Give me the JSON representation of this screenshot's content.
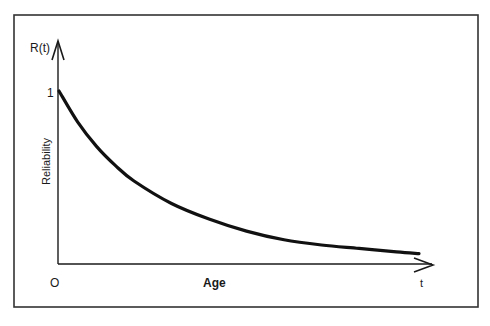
{
  "chart_data": {
    "type": "line",
    "title": "",
    "xlabel": "Age",
    "ylabel": "Reliability",
    "y_axis_symbol": "R(t)",
    "x_axis_symbol": "t",
    "x_tick_labels": [
      "O",
      "t"
    ],
    "y_tick_labels": [
      "1"
    ],
    "grid": false,
    "legend": null,
    "ylim": [
      0,
      1
    ],
    "xlim": [
      0,
      1
    ],
    "series": [
      {
        "name": "R(t)",
        "x": [
          0.0,
          0.05,
          0.1,
          0.15,
          0.2,
          0.3,
          0.4,
          0.5,
          0.6,
          0.7,
          0.8,
          0.9,
          0.96
        ],
        "values": [
          1.0,
          0.82,
          0.68,
          0.57,
          0.48,
          0.35,
          0.26,
          0.19,
          0.14,
          0.11,
          0.09,
          0.07,
          0.06
        ]
      }
    ],
    "annotation": "Exponentially decreasing reliability curve from 1 at age 0"
  },
  "colors": {
    "ink": "#1a1a1a",
    "background": "#ffffff",
    "frame": "#333333"
  }
}
